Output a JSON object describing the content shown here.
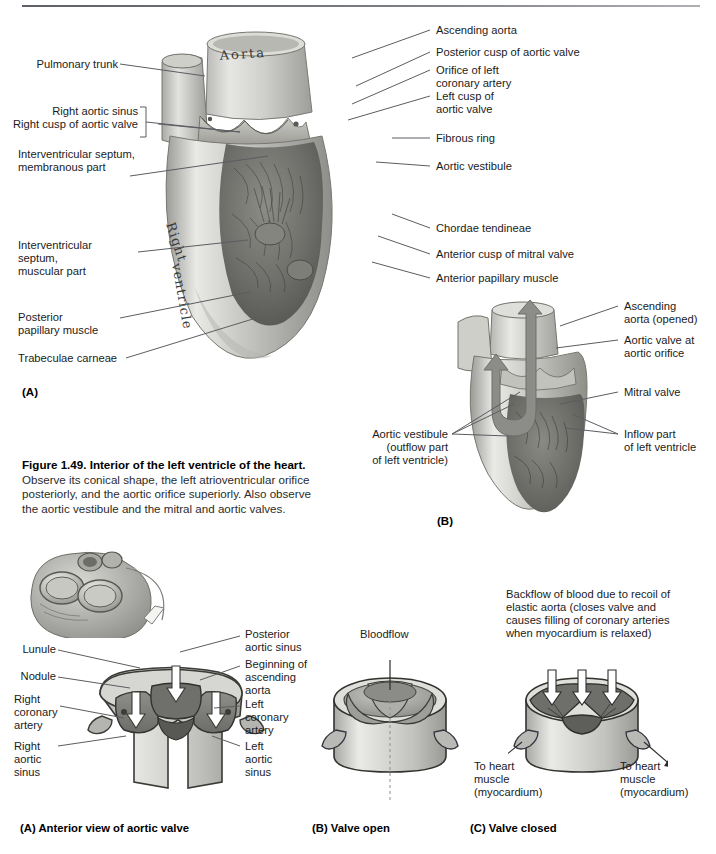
{
  "page": {
    "top_rule": true,
    "background": "#ffffff"
  },
  "figure_top": {
    "panel_a_id": "(A)",
    "panel_b_id": "(B)",
    "art_labels_in_drawing": [
      "Aorta",
      "Right ventricle"
    ],
    "labels_left": [
      {
        "text": "Pulmonary trunk"
      },
      {
        "text": "Right aortic sinus"
      },
      {
        "text": "Right cusp of aortic valve"
      },
      {
        "text": "Interventricular septum,"
      },
      {
        "text": "membranous part"
      },
      {
        "text": "Interventricular"
      },
      {
        "text": "septum,"
      },
      {
        "text": "muscular part"
      },
      {
        "text": "Posterior"
      },
      {
        "text": "papillary muscle"
      },
      {
        "text": "Trabeculae carneae"
      }
    ],
    "labels_right": [
      {
        "text": "Ascending aorta"
      },
      {
        "text": "Posterior cusp of aortic valve"
      },
      {
        "text": "Orifice of left"
      },
      {
        "text": "coronary artery"
      },
      {
        "text": "Left cusp of"
      },
      {
        "text": "aortic valve"
      },
      {
        "text": "Fibrous ring"
      },
      {
        "text": "Aortic vestibule"
      },
      {
        "text": "Chordae tendineae"
      },
      {
        "text": "Anterior cusp of mitral valve"
      },
      {
        "text": "Anterior papillary muscle"
      }
    ],
    "panel_b_labels": [
      {
        "text": "Ascending"
      },
      {
        "text": "aorta (opened)"
      },
      {
        "text": "Aortic valve at"
      },
      {
        "text": "aortic orifice"
      },
      {
        "text": "Mitral valve"
      },
      {
        "text": "Inflow part"
      },
      {
        "text": "of left ventricle"
      },
      {
        "text": "Aortic vestibule"
      },
      {
        "text": "(outflow part"
      },
      {
        "text": "of left ventricle)"
      }
    ]
  },
  "caption": {
    "title": "Figure 1.49. Interior of the left ventricle of the heart.",
    "body": "Observe its conical shape, the left atrioventricular orifice posteriorly, and the aortic orifice superiorly. Also observe the aortic vestibule and the mitral and aortic valves."
  },
  "figure_bottom": {
    "labels_a_left": [
      {
        "text": "Lunule"
      },
      {
        "text": "Nodule"
      },
      {
        "text": "Right"
      },
      {
        "text": "coronary"
      },
      {
        "text": "artery"
      },
      {
        "text": "Right"
      },
      {
        "text": "aortic"
      },
      {
        "text": "sinus"
      }
    ],
    "labels_a_right": [
      {
        "text": "Posterior"
      },
      {
        "text": "aortic sinus"
      },
      {
        "text": "Beginning of"
      },
      {
        "text": "ascending"
      },
      {
        "text": "aorta"
      },
      {
        "text": "Left"
      },
      {
        "text": "coronary"
      },
      {
        "text": "artery"
      },
      {
        "text": "Left"
      },
      {
        "text": "aortic"
      },
      {
        "text": "sinus"
      }
    ],
    "panel_b_annotation": "Bloodflow",
    "panel_c_annotation": [
      "Backflow of blood due to recoil of",
      "elastic aorta (closes valve and",
      "causes filling of coronary arteries",
      "when myocardium is relaxed)"
    ],
    "panel_c_left_note": [
      "To heart",
      "muscle",
      "(myocardium)"
    ],
    "panel_c_right_note": [
      "To heart",
      "muscle",
      "(myocardium)"
    ],
    "captions": [
      {
        "text": "(A) Anterior view of aortic valve"
      },
      {
        "text": "(B) Valve open"
      },
      {
        "text": "(C) Valve closed"
      }
    ]
  }
}
